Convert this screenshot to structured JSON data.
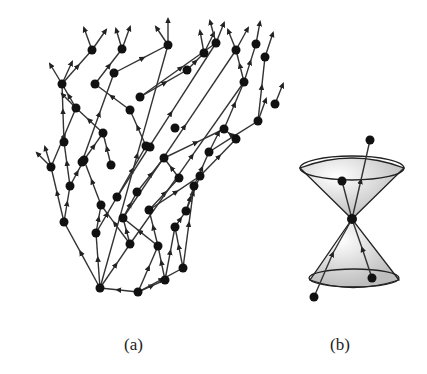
{
  "figure": {
    "panels": [
      {
        "id": "a",
        "caption": "(a)",
        "description": "Causal set: directed acyclic graph of points with upward-pointing arrows",
        "nodes": [
          [
            138,
            292
          ],
          [
            100,
            288
          ],
          [
            165,
            280
          ],
          [
            183,
            268
          ],
          [
            158,
            246
          ],
          [
            175,
            227
          ],
          [
            130,
            244
          ],
          [
            96,
            233
          ],
          [
            64,
            222
          ],
          [
            123,
            218
          ],
          [
            149,
            210
          ],
          [
            101,
            205
          ],
          [
            186,
            211
          ],
          [
            194,
            186
          ],
          [
            200,
            176
          ],
          [
            179,
            178
          ],
          [
            117,
            197
          ],
          [
            137,
            192
          ],
          [
            70,
            186
          ],
          [
            84,
            160
          ],
          [
            51,
            167
          ],
          [
            164,
            158
          ],
          [
            146,
            146
          ],
          [
            111,
            165
          ],
          [
            209,
            152
          ],
          [
            236,
            139
          ],
          [
            258,
            121
          ],
          [
            224,
            129
          ],
          [
            130,
            110
          ],
          [
            103,
            133
          ],
          [
            82,
            162
          ],
          [
            76,
            108
          ],
          [
            64,
            142
          ],
          [
            62,
            84
          ],
          [
            95,
            84
          ],
          [
            114,
            73
          ],
          [
            140,
            97
          ],
          [
            168,
            45
          ],
          [
            122,
            49
          ],
          [
            92,
            50
          ],
          [
            187,
            70
          ],
          [
            216,
            43
          ],
          [
            244,
            82
          ],
          [
            265,
            57
          ],
          [
            256,
            44
          ],
          [
            236,
            50
          ],
          [
            275,
            104
          ],
          [
            204,
            53
          ],
          [
            150,
            147
          ],
          [
            175,
            128
          ]
        ],
        "edges": [
          [
            0,
            1
          ],
          [
            0,
            2
          ],
          [
            0,
            3
          ],
          [
            0,
            4
          ],
          [
            1,
            6
          ],
          [
            1,
            7
          ],
          [
            1,
            8
          ],
          [
            2,
            5
          ],
          [
            2,
            4
          ],
          [
            3,
            5
          ],
          [
            3,
            13
          ],
          [
            4,
            10
          ],
          [
            4,
            9
          ],
          [
            5,
            12
          ],
          [
            6,
            9
          ],
          [
            6,
            11
          ],
          [
            7,
            11
          ],
          [
            7,
            16
          ],
          [
            8,
            18
          ],
          [
            8,
            20
          ],
          [
            9,
            17
          ],
          [
            10,
            15
          ],
          [
            10,
            14
          ],
          [
            11,
            19
          ],
          [
            12,
            14
          ],
          [
            12,
            13
          ],
          [
            13,
            24
          ],
          [
            14,
            25
          ],
          [
            15,
            21
          ],
          [
            16,
            22
          ],
          [
            17,
            21
          ],
          [
            18,
            19
          ],
          [
            18,
            32
          ],
          [
            19,
            29
          ],
          [
            20,
            31
          ],
          [
            21,
            27
          ],
          [
            22,
            28
          ],
          [
            23,
            29
          ],
          [
            24,
            26
          ],
          [
            25,
            27
          ],
          [
            26,
            43
          ],
          [
            27,
            42
          ],
          [
            28,
            34
          ],
          [
            29,
            31
          ],
          [
            31,
            33
          ],
          [
            32,
            33
          ],
          [
            33,
            39
          ],
          [
            34,
            38
          ],
          [
            35,
            37
          ],
          [
            36,
            40
          ],
          [
            40,
            47
          ],
          [
            42,
            44
          ],
          [
            42,
            45
          ],
          [
            36,
            41
          ],
          [
            9,
            45
          ],
          [
            6,
            42
          ],
          [
            1,
            37
          ],
          [
            30,
            35
          ],
          [
            16,
            41
          ]
        ],
        "open_arrows_top": 22
      },
      {
        "id": "b",
        "caption": "(b)",
        "description": "Light cone: future and past cones joined at an event with a worldline passing through",
        "apex": [
          352,
          219
        ],
        "points": [
          [
            342,
            181
          ],
          [
            372,
            278
          ],
          [
            314,
            297
          ],
          [
            370,
            140
          ]
        ]
      }
    ]
  }
}
